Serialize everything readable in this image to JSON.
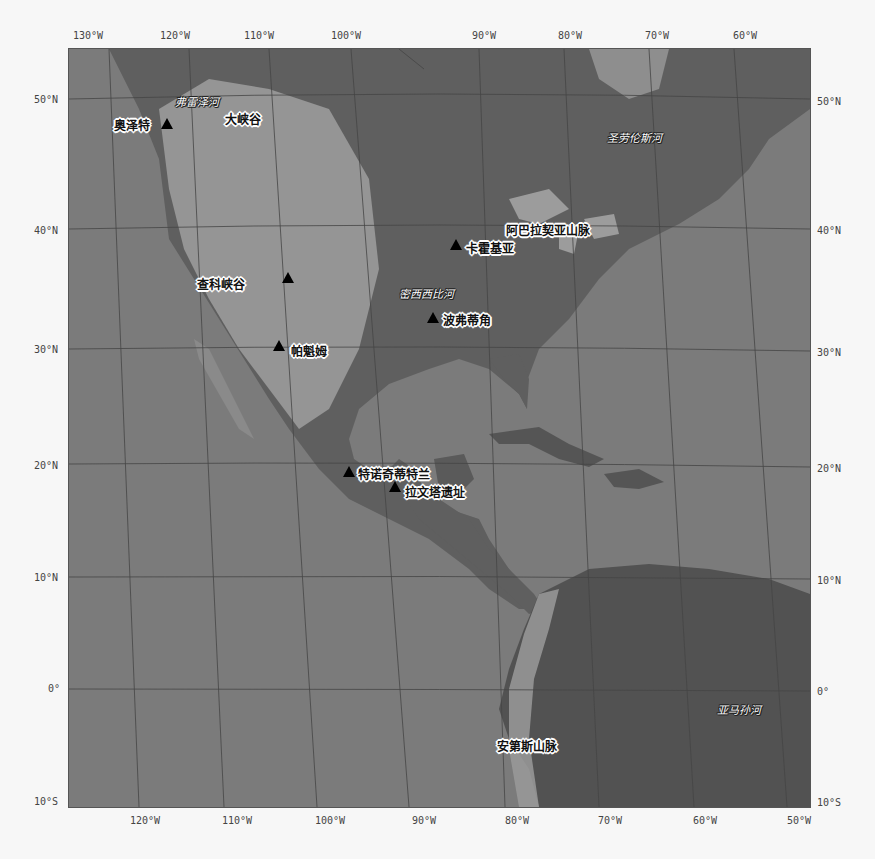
{
  "map": {
    "projection": "rotated lat/lon graticule",
    "colors": {
      "ocean": "#7a7a7a",
      "land": "#5e5e5e",
      "highland": "#a8a8a8",
      "lake": "#9a9a9a",
      "graticule": "#444444",
      "background": "#f7f7f7"
    },
    "top_ticks": [
      "130°W",
      "120°W",
      "110°W",
      "100°W",
      "90°W",
      "80°W",
      "70°W",
      "60°W"
    ],
    "bottom_ticks": [
      "120°W",
      "110°W",
      "100°W",
      "90°W",
      "80°W",
      "70°W",
      "60°W",
      "50°W"
    ],
    "left_ticks": [
      "50°N",
      "40°N",
      "30°N",
      "20°N",
      "10°N",
      "0°",
      "10°S"
    ],
    "right_ticks": [
      "50°N",
      "40°N",
      "30°N",
      "20°N",
      "10°N",
      "0°",
      "10°S"
    ],
    "sites": [
      {
        "name": "奥泽特"
      },
      {
        "name": "查科峡谷"
      },
      {
        "name": "帕魁姆"
      },
      {
        "name": "卡霍基亚"
      },
      {
        "name": "波弗蒂角"
      },
      {
        "name": "特诺奇蒂特兰"
      },
      {
        "name": "拉文塔遗址"
      }
    ],
    "features": [
      {
        "name": "弗雷泽河",
        "type": "river"
      },
      {
        "name": "大峡谷",
        "type": "landform"
      },
      {
        "name": "圣劳伦斯河",
        "type": "river"
      },
      {
        "name": "阿巴拉契亚山脉",
        "type": "mountains"
      },
      {
        "name": "密西西比河",
        "type": "river"
      },
      {
        "name": "安第斯山脉",
        "type": "mountains"
      },
      {
        "name": "亚马孙河",
        "type": "river"
      }
    ]
  }
}
